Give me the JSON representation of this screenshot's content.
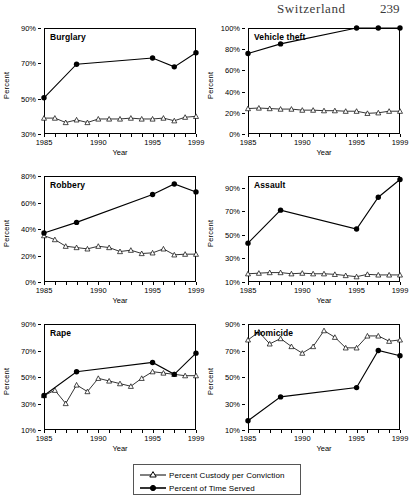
{
  "header": {
    "title": "Switzerland",
    "page_number": "239"
  },
  "axis": {
    "y_title": "Percent",
    "x_title": "Year"
  },
  "legend": {
    "items": [
      {
        "label": "Percent Custody per Conviction",
        "marker": "open-triangle",
        "color": "#000000"
      },
      {
        "label": "Percent of Time Served",
        "marker": "filled-circle",
        "color": "#000000"
      }
    ]
  },
  "chart_data": [
    {
      "type": "line",
      "title": "Burglary",
      "xlabel": "Year",
      "ylabel": "Percent",
      "xlim": [
        1985,
        1999
      ],
      "ylim": [
        30,
        90
      ],
      "yticks": [
        30,
        50,
        70,
        90
      ],
      "ytick_labels": [
        "30%",
        "50%",
        "70%",
        "90%"
      ],
      "xticks": [
        1985,
        1990,
        1995,
        1999
      ],
      "xtick_labels": [
        "1985",
        "1990",
        "1995",
        "1999"
      ],
      "grid": false,
      "legend_position": "figure-bottom",
      "series": [
        {
          "name": "Percent Custody per Conviction",
          "marker": "open-triangle",
          "x": [
            1985,
            1986,
            1987,
            1988,
            1989,
            1990,
            1991,
            1992,
            1993,
            1994,
            1995,
            1996,
            1997,
            1998,
            1999
          ],
          "values": [
            39,
            39,
            36.5,
            38,
            36.5,
            38.5,
            38.5,
            38.5,
            39,
            38.5,
            38.5,
            39,
            37.5,
            39.5,
            40
          ]
        },
        {
          "name": "Percent of Time Served",
          "marker": "filled-circle",
          "x": [
            1985,
            1988,
            1995,
            1997,
            1999
          ],
          "values": [
            50.5,
            69.5,
            73,
            68,
            76
          ]
        }
      ]
    },
    {
      "type": "line",
      "title": "Vehicle theft",
      "xlabel": "Year",
      "ylabel": "Percent",
      "xlim": [
        1985,
        1999
      ],
      "ylim": [
        0,
        100
      ],
      "yticks": [
        0,
        20,
        40,
        60,
        80,
        100
      ],
      "ytick_labels": [
        "0%",
        "20%",
        "40%",
        "60%",
        "80%",
        "100%"
      ],
      "xticks": [
        1985,
        1990,
        1995,
        1999
      ],
      "xtick_labels": [
        "1985",
        "1990",
        "1995",
        "1999"
      ],
      "grid": false,
      "legend_position": "figure-bottom",
      "series": [
        {
          "name": "Percent Custody per Conviction",
          "marker": "open-triangle",
          "x": [
            1985,
            1986,
            1987,
            1988,
            1989,
            1990,
            1991,
            1992,
            1993,
            1994,
            1995,
            1996,
            1997,
            1998,
            1999
          ],
          "values": [
            24,
            24.5,
            24,
            23.5,
            23.5,
            22.5,
            22.5,
            22,
            22,
            21.5,
            21.5,
            19.5,
            20,
            21.5,
            21.5
          ]
        },
        {
          "name": "Percent of Time Served",
          "marker": "filled-circle",
          "x": [
            1985,
            1988,
            1995,
            1997,
            1999
          ],
          "values": [
            76,
            85,
            100,
            100,
            100
          ]
        }
      ]
    },
    {
      "type": "line",
      "title": "Robbery",
      "xlabel": "Year",
      "ylabel": "Percent",
      "xlim": [
        1985,
        1999
      ],
      "ylim": [
        0,
        80
      ],
      "yticks": [
        0,
        20,
        40,
        60,
        80
      ],
      "ytick_labels": [
        "0%",
        "20%",
        "40%",
        "60%",
        "80%"
      ],
      "xticks": [
        1985,
        1990,
        1995,
        1999
      ],
      "xtick_labels": [
        "1985",
        "1990",
        "1995",
        "1999"
      ],
      "grid": false,
      "legend_position": "figure-bottom",
      "series": [
        {
          "name": "Percent Custody per Conviction",
          "marker": "open-triangle",
          "x": [
            1985,
            1986,
            1987,
            1988,
            1989,
            1990,
            1991,
            1992,
            1993,
            1994,
            1995,
            1996,
            1997,
            1998,
            1999
          ],
          "values": [
            35,
            32,
            27,
            26,
            25,
            27,
            26,
            23,
            24,
            21.5,
            22,
            25,
            20.5,
            21,
            21
          ]
        },
        {
          "name": "Percent of Time Served",
          "marker": "filled-circle",
          "x": [
            1985,
            1988,
            1995,
            1997,
            1999
          ],
          "values": [
            37,
            45,
            66,
            74,
            68
          ]
        }
      ]
    },
    {
      "type": "line",
      "title": "Assault",
      "xlabel": "Year",
      "ylabel": "Percent",
      "xlim": [
        1985,
        1999
      ],
      "ylim": [
        10,
        100
      ],
      "yticks": [
        10,
        30,
        50,
        70,
        90
      ],
      "ytick_labels": [
        "10%",
        "30%",
        "50%",
        "70%",
        "90%"
      ],
      "xticks": [
        1985,
        1990,
        1995,
        1999
      ],
      "xtick_labels": [
        "1985",
        "1990",
        "1995",
        "1999"
      ],
      "grid": false,
      "legend_position": "figure-bottom",
      "series": [
        {
          "name": "Percent Custody per Conviction",
          "marker": "open-triangle",
          "x": [
            1985,
            1986,
            1987,
            1988,
            1989,
            1990,
            1991,
            1992,
            1993,
            1994,
            1995,
            1996,
            1997,
            1998,
            1999
          ],
          "values": [
            17,
            17.5,
            18,
            18,
            17,
            17.5,
            17,
            17,
            16.5,
            15.5,
            14.5,
            16.5,
            16,
            16,
            16
          ]
        },
        {
          "name": "Percent of Time Served",
          "marker": "filled-circle",
          "x": [
            1985,
            1988,
            1995,
            1997,
            1999
          ],
          "values": [
            43,
            71,
            55,
            82,
            97
          ]
        }
      ]
    },
    {
      "type": "line",
      "title": "Rape",
      "xlabel": "Year",
      "ylabel": "Percent",
      "xlim": [
        1985,
        1999
      ],
      "ylim": [
        10,
        90
      ],
      "yticks": [
        10,
        30,
        50,
        70,
        90
      ],
      "ytick_labels": [
        "10%",
        "30%",
        "50%",
        "70%",
        "90%"
      ],
      "xticks": [
        1985,
        1990,
        1995,
        1999
      ],
      "xtick_labels": [
        "1985",
        "1990",
        "1995",
        "1999"
      ],
      "grid": false,
      "legend_position": "figure-bottom",
      "series": [
        {
          "name": "Percent Custody per Conviction",
          "marker": "open-triangle",
          "x": [
            1985,
            1986,
            1987,
            1988,
            1989,
            1990,
            1991,
            1992,
            1993,
            1994,
            1995,
            1996,
            1997,
            1998,
            1999
          ],
          "values": [
            36,
            40,
            30,
            44,
            39,
            49,
            47,
            45,
            43,
            49,
            54,
            53,
            52,
            51,
            51
          ]
        },
        {
          "name": "Percent of Time Served",
          "marker": "filled-circle",
          "x": [
            1985,
            1988,
            1995,
            1997,
            1999
          ],
          "values": [
            36,
            54,
            61,
            52,
            68
          ]
        }
      ]
    },
    {
      "type": "line",
      "title": "Homicide",
      "xlabel": "Year",
      "ylabel": "Percent",
      "xlim": [
        1985,
        1999
      ],
      "ylim": [
        10,
        90
      ],
      "yticks": [
        10,
        30,
        50,
        70,
        90
      ],
      "ytick_labels": [
        "10%",
        "30%",
        "50%",
        "70%",
        "90%"
      ],
      "xticks": [
        1985,
        1990,
        1995,
        1999
      ],
      "xtick_labels": [
        "1985",
        "1990",
        "1995",
        "1999"
      ],
      "grid": false,
      "legend_position": "figure-bottom",
      "series": [
        {
          "name": "Percent Custody per Conviction",
          "marker": "open-triangle",
          "x": [
            1985,
            1986,
            1987,
            1988,
            1989,
            1990,
            1991,
            1992,
            1993,
            1994,
            1995,
            1996,
            1997,
            1998,
            1999
          ],
          "values": [
            78,
            84,
            75,
            79,
            73,
            68,
            73,
            85,
            80,
            72,
            72,
            81,
            81,
            77,
            78
          ]
        },
        {
          "name": "Percent of Time Served",
          "marker": "filled-circle",
          "x": [
            1985,
            1988,
            1995,
            1997,
            1999
          ],
          "values": [
            17,
            35,
            42,
            70,
            66
          ]
        }
      ]
    }
  ]
}
